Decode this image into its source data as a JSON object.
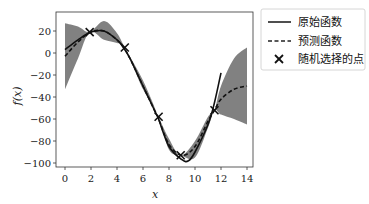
{
  "chart_data": {
    "type": "line",
    "title": "",
    "xlabel": "x",
    "ylabel": "f(x)",
    "xlim": [
      -0.5,
      14.5
    ],
    "ylim": [
      -105,
      35
    ],
    "xticks": [
      0,
      2,
      4,
      6,
      8,
      10,
      12,
      14
    ],
    "yticks": [
      20,
      0,
      -20,
      -40,
      -60,
      -80,
      -100
    ],
    "grid": false,
    "legend_position": "outside-right-top",
    "legend": [
      "原始函数",
      "预测函数",
      "随机选择的点"
    ],
    "series": [
      {
        "name": "原始函数",
        "style": "solid",
        "x": [
          0,
          1,
          2,
          3,
          4,
          4.5,
          5,
          6,
          7,
          7.2,
          8,
          9,
          9.5,
          10,
          11,
          11.5,
          12
        ],
        "y": [
          3,
          12,
          19,
          20,
          12,
          5,
          -5,
          -30,
          -55,
          -60,
          -85,
          -97,
          -98,
          -90,
          -65,
          -45,
          -18
        ]
      },
      {
        "name": "预测函数",
        "style": "dashed",
        "x": [
          0,
          1,
          2,
          3,
          4,
          4.5,
          5,
          6,
          7,
          7.2,
          8,
          9,
          10,
          11,
          11.5,
          12,
          13,
          14
        ],
        "y": [
          -3,
          10,
          19,
          20,
          12,
          5,
          -5,
          -30,
          -55,
          -60,
          -83,
          -93,
          -85,
          -62,
          -52,
          -42,
          -33,
          -30
        ]
      },
      {
        "name": "随机选择的点",
        "style": "marker-x",
        "x": [
          1.9,
          4.6,
          7.2,
          8.9,
          11.5
        ],
        "y": [
          19,
          5,
          -58,
          -93,
          -52
        ]
      }
    ],
    "confidence_band": {
      "x": [
        0,
        1,
        1.9,
        3,
        4,
        4.6,
        6,
        7.2,
        8,
        8.9,
        10,
        11,
        11.5,
        12,
        13,
        14
      ],
      "upper": [
        27,
        24,
        19,
        29,
        18,
        5,
        -25,
        -58,
        -78,
        -93,
        -80,
        -58,
        -52,
        -30,
        -5,
        5
      ],
      "lower": [
        -33,
        -5,
        19,
        12,
        9,
        5,
        -33,
        -58,
        -88,
        -93,
        -95,
        -68,
        -52,
        -56,
        -60,
        -65
      ]
    }
  }
}
